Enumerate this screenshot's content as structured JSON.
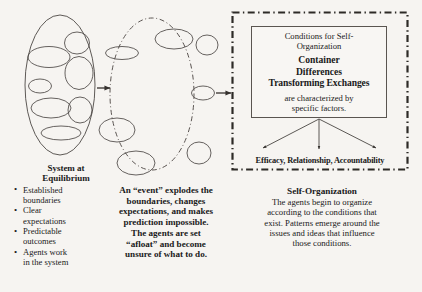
{
  "canvas": {
    "width": 422,
    "height": 292,
    "background": "#f6f4f1",
    "ink": "#333333"
  },
  "left_panel": {
    "shape_name": "system-at-equilibrium-ellipse",
    "title": "System at\nEquilibrium",
    "title_line1": "System at",
    "title_line2": "Equilibrium",
    "bullets": [
      "Established boundaries",
      "Clear expectations",
      "Predictable outcomes",
      "Agents work in the system"
    ],
    "bullets_wrapped": [
      [
        "Established",
        "boundaries"
      ],
      [
        "Clear",
        "expectations"
      ],
      [
        "Predictable",
        "outcomes"
      ],
      [
        "Agents work",
        "in the system"
      ]
    ]
  },
  "middle_panel": {
    "shape_name": "event-disrupted-ellipse",
    "caption_lines": [
      "An “event” explodes the",
      "boundaries, changes",
      "expectations, and makes",
      "prediction impossible.",
      "The agents are set",
      "“afloat” and become",
      "unsure of what to do."
    ]
  },
  "right_panel": {
    "shape_name": "self-organization-container",
    "inner_box": {
      "heading_lines": [
        "Conditions for Self-",
        "Organization"
      ],
      "bold_lines": [
        "Container",
        "Differences",
        "Transforming Exchanges"
      ],
      "tail_lines": [
        "are characterized by",
        "specific factors."
      ]
    },
    "factors_label": "Efficacy, Relationship, Accountability",
    "caption_title": "Self-Organization",
    "caption_lines": [
      "The agents begin to organize",
      "according to the conditions that",
      "exist. Patterns emerge around the",
      "issues and ideas that influence",
      "those conditions."
    ]
  },
  "arrows": [
    {
      "name": "arrow-equilibrium-to-event",
      "from": "system-at-equilibrium-ellipse",
      "to": "event-disrupted-ellipse"
    },
    {
      "name": "arrow-event-to-self-organization",
      "from": "event-disrupted-ellipse",
      "to": "self-organization-container"
    },
    {
      "name": "arrow-conditions-to-factors-left",
      "from": "inner-conditions-box",
      "to": "factors-label"
    },
    {
      "name": "arrow-conditions-to-factors-center",
      "from": "inner-conditions-box",
      "to": "factors-label"
    },
    {
      "name": "arrow-conditions-to-factors-right",
      "from": "inner-conditions-box",
      "to": "factors-label"
    }
  ]
}
